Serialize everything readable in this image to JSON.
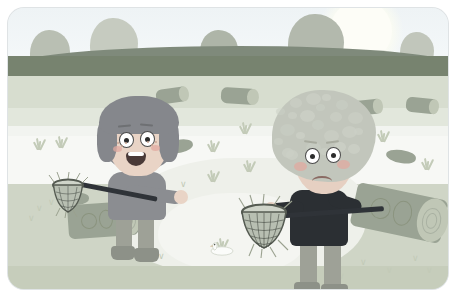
{
  "scene": {
    "title": "Two children fishing by a pond",
    "type": "childrens-book-illustration",
    "frame": {
      "corner_radius_px": 16,
      "border_color": "#ffffff",
      "width_px": 440,
      "height_px": 281
    }
  },
  "palette": {
    "sky_top": "#eef3f5",
    "sky_bottom": "#f6f9fa",
    "sun": "#fdfdf7",
    "hill": "#7f8a7b",
    "tree_crown": "#b9bfb3",
    "tree_crown_dark": "#9aa394",
    "tree_trunk": "#7e8b79",
    "bank": "#d7ddcf",
    "water": "#f2f4f0",
    "water_light": "#f7f8f5",
    "front_bank": "#cfd5c6",
    "shore": "#c6cdbb",
    "log_body": "#9aa394",
    "log_end": "#c0c7b6",
    "girl_hair": "#85878c",
    "girl_shirt": "#8b8d91",
    "girl_skin": "#e9d4c6",
    "boy_hair": "#c2c6bc",
    "boy_shirt": "#2b2f33",
    "boy_skin": "#e6d0c2",
    "cheek_blush": "#e0a9a0",
    "net_mesh": "#555b52",
    "pants": "#9ea197",
    "boots": "#8d9188"
  },
  "sky": {
    "sun_label": "sun",
    "sun_x": 322,
    "sun_y": -8,
    "sun_size": 62
  },
  "hills": {
    "label": "rolling hill ridge",
    "top_px": 38,
    "height_px": 36
  },
  "trees": [
    {
      "name": "tree-1",
      "x": 22,
      "y": 22,
      "crown_w": 40,
      "crown_h": 46,
      "trunk_h": 34,
      "shade": "#b9bfb3",
      "branch": false
    },
    {
      "name": "tree-2",
      "x": 82,
      "y": 10,
      "crown_w": 48,
      "crown_h": 54,
      "trunk_h": 44,
      "shade": "#c6cbc0",
      "branch": true
    },
    {
      "name": "tree-3",
      "x": 192,
      "y": 22,
      "crown_w": 38,
      "crown_h": 42,
      "trunk_h": 34,
      "shade": "#aeb5a8",
      "branch": false
    },
    {
      "name": "tree-4",
      "x": 280,
      "y": 6,
      "crown_w": 56,
      "crown_h": 60,
      "trunk_h": 52,
      "shade": "#b3b9ad",
      "branch": true
    },
    {
      "name": "tree-5",
      "x": 392,
      "y": 24,
      "crown_w": 34,
      "crown_h": 40,
      "trunk_h": 34,
      "shade": "#c1c6bb",
      "branch": false
    }
  ],
  "background_logs": [
    {
      "name": "log-bg-1",
      "x": 148,
      "y": 80,
      "w": 32,
      "h": 15,
      "rot": -8
    },
    {
      "name": "log-bg-2",
      "x": 213,
      "y": 80,
      "w": 36,
      "h": 16,
      "rot": 4
    },
    {
      "name": "log-bg-3",
      "x": 340,
      "y": 92,
      "w": 34,
      "h": 15,
      "rot": -6
    },
    {
      "name": "log-bg-4",
      "x": 398,
      "y": 90,
      "w": 32,
      "h": 15,
      "rot": 6
    }
  ],
  "foreground_logs": [
    {
      "name": "log-girl",
      "x": 60,
      "y": 195,
      "w": 70,
      "h": 34,
      "rot": -4
    },
    {
      "name": "log-boy",
      "x": 345,
      "y": 183,
      "w": 92,
      "h": 44,
      "rot": 12
    }
  ],
  "lily_pads": [
    {
      "name": "lilypad-1",
      "x": 155,
      "y": 132,
      "w": 30,
      "h": 13,
      "rot": -12
    },
    {
      "name": "lilypad-2",
      "x": 378,
      "y": 142,
      "w": 30,
      "h": 13,
      "rot": 8
    },
    {
      "name": "lilypad-3",
      "x": 55,
      "y": 185,
      "w": 26,
      "h": 12,
      "rot": -6
    }
  ],
  "grass_tufts": [
    {
      "name": "grass-1",
      "x": 22,
      "y": 128
    },
    {
      "name": "grass-2",
      "x": 44,
      "y": 126
    },
    {
      "name": "grass-3",
      "x": 196,
      "y": 130
    },
    {
      "name": "grass-4",
      "x": 228,
      "y": 112
    },
    {
      "name": "grass-5",
      "x": 232,
      "y": 150
    },
    {
      "name": "grass-6",
      "x": 196,
      "y": 160
    },
    {
      "name": "grass-7",
      "x": 366,
      "y": 120
    },
    {
      "name": "grass-8",
      "x": 410,
      "y": 148
    },
    {
      "name": "grass-9",
      "x": 205,
      "y": 228
    }
  ],
  "ground_ticks": [
    {
      "x": 28,
      "y": 196
    },
    {
      "x": 40,
      "y": 190
    },
    {
      "x": 20,
      "y": 206
    },
    {
      "x": 150,
      "y": 244
    },
    {
      "x": 172,
      "y": 172
    },
    {
      "x": 352,
      "y": 250
    },
    {
      "x": 378,
      "y": 258
    },
    {
      "x": 404,
      "y": 246
    },
    {
      "x": 418,
      "y": 258
    },
    {
      "x": 330,
      "y": 264
    }
  ],
  "duck": {
    "name": "duck",
    "x": 198,
    "y": 232,
    "label": "small white duck on the water"
  },
  "girl": {
    "name": "girl-character",
    "x": 78,
    "y": 88,
    "expression": "smiling, mouth open",
    "hair_style": "bob with hat-like fringe",
    "holding": "fishing net on a long pole",
    "features": [
      "freckles",
      "two round eyes",
      "open smile"
    ],
    "net": {
      "name": "net-girl",
      "x": 42,
      "y": 168,
      "size": 30
    },
    "pole": {
      "name": "net-pole-girl",
      "from_x": 58,
      "from_y": 182,
      "to_x": 146,
      "to_y": 200
    }
  },
  "boy": {
    "name": "boy-character",
    "x": 258,
    "y": 82,
    "expression": "sad, frowning",
    "hair_style": "big curly afro",
    "holding": "fishing net on a long pole",
    "features": [
      "rosy cheeks",
      "downturned mouth",
      "two round eyes"
    ],
    "net": {
      "name": "net-boy",
      "x": 232,
      "y": 192,
      "size": 48
    },
    "pole": {
      "name": "net-pole-boy",
      "from_x": 262,
      "from_y": 208,
      "to_x": 372,
      "to_y": 196
    }
  },
  "labels": {
    "scene_caption": ""
  }
}
